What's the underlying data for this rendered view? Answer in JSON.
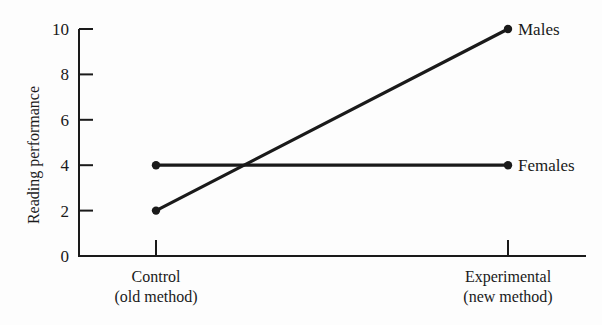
{
  "chart_data": {
    "type": "line",
    "title": "",
    "xlabel": "",
    "ylabel": "Reading performance",
    "categories": [
      "Control\n(old method)",
      "Experimental\n(new method)"
    ],
    "category_lines": [
      [
        "Control",
        "(old method)"
      ],
      [
        "Experimental",
        "(new method)"
      ]
    ],
    "series": [
      {
        "name": "Males",
        "values": [
          2,
          10
        ]
      },
      {
        "name": "Females",
        "values": [
          4,
          4
        ]
      }
    ],
    "ylim": [
      0,
      10
    ],
    "yticks": [
      0,
      2,
      4,
      6,
      8,
      10
    ],
    "grid": false,
    "legend": "inline labels at line ends",
    "colors": {
      "ink": "#1a1a1a",
      "background": "#fdfdfd"
    }
  }
}
